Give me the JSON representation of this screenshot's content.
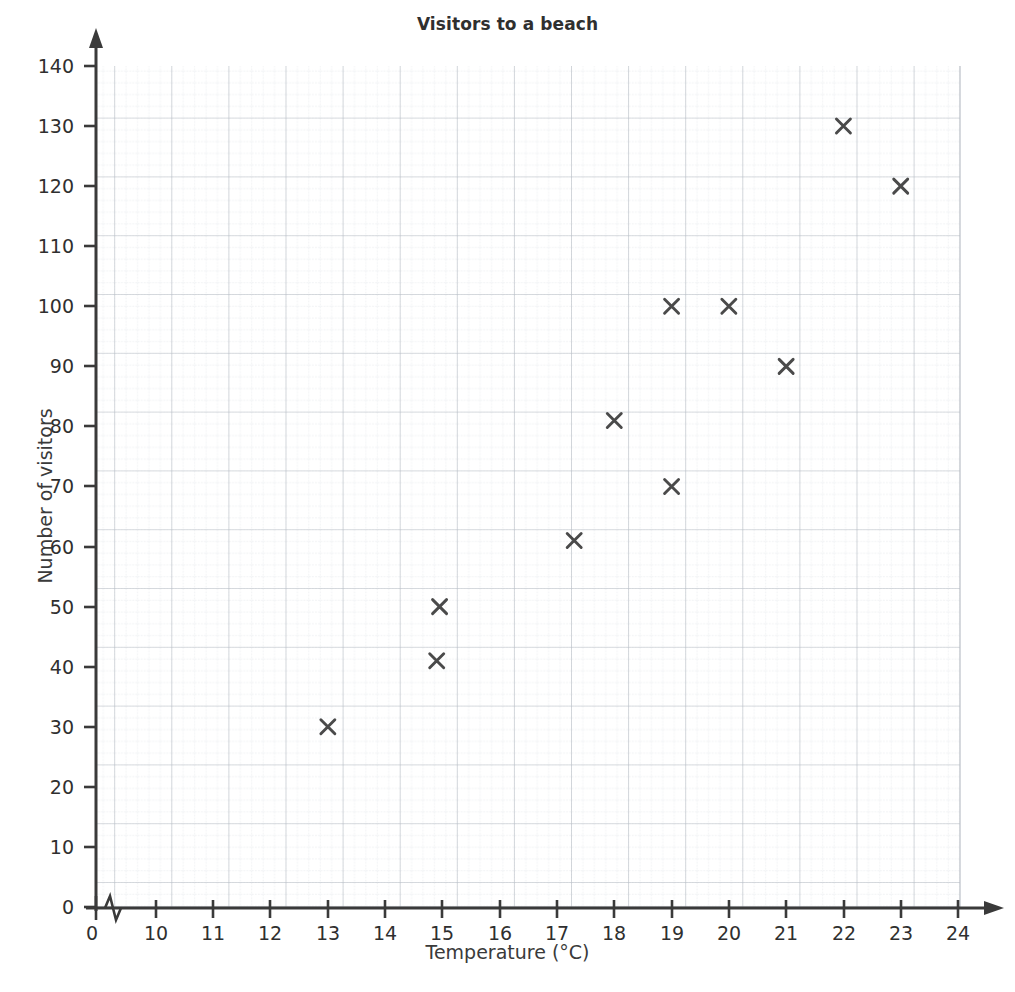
{
  "chart_data": {
    "type": "scatter",
    "title": "Visitors to a beach",
    "xlabel": "Temperature (°C)",
    "ylabel": "Number of visitors",
    "xlim": [
      10,
      24
    ],
    "ylim": [
      0,
      140
    ],
    "x_origin_tick": "0",
    "axis_break": true,
    "grid": true,
    "grid_major_x_step": 1,
    "grid_major_y_step": 10,
    "grid_minor_divisions": 5,
    "marker": "x",
    "marker_color": "#4a4a4a",
    "legend": null,
    "x_ticks": [
      "10",
      "11",
      "12",
      "13",
      "14",
      "15",
      "16",
      "17",
      "18",
      "19",
      "20",
      "21",
      "22",
      "23",
      "24"
    ],
    "y_ticks": [
      "0",
      "10",
      "20",
      "30",
      "40",
      "50",
      "60",
      "70",
      "80",
      "90",
      "100",
      "110",
      "120",
      "130",
      "140"
    ],
    "points": [
      {
        "x": 13.0,
        "y": 30
      },
      {
        "x": 14.9,
        "y": 41
      },
      {
        "x": 14.95,
        "y": 50
      },
      {
        "x": 17.3,
        "y": 61
      },
      {
        "x": 18.0,
        "y": 81
      },
      {
        "x": 19.0,
        "y": 70
      },
      {
        "x": 19.0,
        "y": 100
      },
      {
        "x": 20.0,
        "y": 100
      },
      {
        "x": 21.0,
        "y": 90
      },
      {
        "x": 22.0,
        "y": 130
      },
      {
        "x": 23.0,
        "y": 120
      }
    ]
  },
  "colors": {
    "axis": "#3a3a3a",
    "grid_major": "#b9bec6",
    "grid_minor": "#d7dbe0",
    "marker": "#4a4a4a",
    "text": "#2f2f2f",
    "background": "#ffffff"
  }
}
